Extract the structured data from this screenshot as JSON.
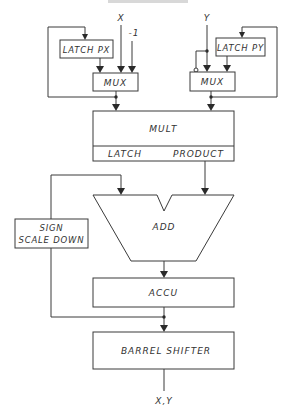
{
  "diagram": {
    "inputs": {
      "x": "X",
      "minus_one": "-1",
      "y": "Y"
    },
    "blocks": {
      "latch_px": "LATCH PX",
      "latch_py": "LATCH PY",
      "mux_left": "MUX",
      "mux_right": "MUX",
      "mult": "MULT",
      "latch": "LATCH",
      "product": "PRODUCT",
      "add": "ADD",
      "sign_line1": "SIGN",
      "sign_line2": "SCALE DOWN",
      "accu": "ACCU",
      "barrel_shifter": "BARREL SHIFTER"
    },
    "output": "X,Y"
  }
}
